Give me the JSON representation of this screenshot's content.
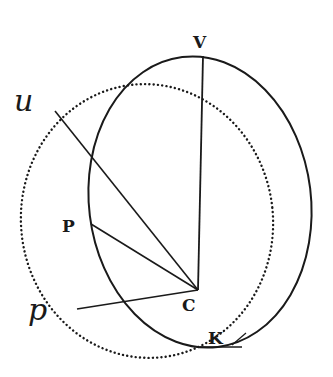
{
  "diagram": {
    "type": "geometry",
    "colors": {
      "ink": "#1a1a1a",
      "background": "#ffffff"
    },
    "labels": {
      "V": "V",
      "u": "u",
      "P": "P",
      "C": "C",
      "p": "p",
      "K": "K"
    },
    "points": {
      "V": [
        203,
        56
      ],
      "C": [
        198,
        290
      ],
      "u": [
        55,
        111
      ],
      "P": [
        91,
        224
      ],
      "p": [
        77,
        309
      ],
      "K": [
        205,
        348
      ]
    },
    "shapes": {
      "solid_ellipse": {
        "cx": 200,
        "cy": 202,
        "rx": 111,
        "ry": 146,
        "style": "solid"
      },
      "dotted_circle": {
        "cx": 147,
        "cy": 221,
        "rx": 126,
        "ry": 137,
        "style": "dotted"
      }
    },
    "segments": [
      {
        "from": "V",
        "to": "C"
      },
      {
        "from": "u",
        "to": "C"
      },
      {
        "from": "P",
        "to": "C"
      },
      {
        "from": "p",
        "to": "C"
      },
      {
        "from": "K",
        "to": "K-tangent"
      }
    ]
  }
}
